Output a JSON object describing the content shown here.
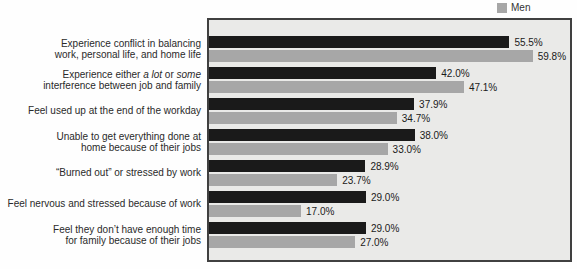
{
  "chart_data": {
    "type": "bar",
    "orientation": "horizontal",
    "title": "",
    "xlabel": "",
    "ylabel": "",
    "xlim": [
      0,
      66.7
    ],
    "grid": false,
    "plot": {
      "background": "#eaeae8",
      "border_color": "#404040"
    },
    "legend": {
      "position": "top-right",
      "items": [
        {
          "label": "Men",
          "color": "#a7a7a7"
        }
      ]
    },
    "categories": [
      {
        "lines": [
          "Experience conflict in balancing",
          "work, personal life, and home life"
        ]
      },
      {
        "lines": [
          [
            {
              "text": "Experience either "
            },
            {
              "text": "a lot",
              "italic": true
            },
            {
              "text": " or "
            },
            {
              "text": "some",
              "italic": true
            }
          ],
          "interference between job and family"
        ]
      },
      {
        "lines": [
          "Feel used up at the end of the workday"
        ]
      },
      {
        "lines": [
          "Unable to get everything done at",
          "home because of their jobs"
        ]
      },
      {
        "lines": [
          "“Burned out” or stressed by work"
        ]
      },
      {
        "lines": [
          "Feel nervous and stressed because of work"
        ]
      },
      {
        "lines": [
          "Feel they don’t have enough time",
          "for family because of their jobs"
        ]
      }
    ],
    "series": [
      {
        "legend_label": "",
        "color": "#1a1a1a",
        "values": [
          55.5,
          42.0,
          37.9,
          38.0,
          28.9,
          29.0,
          29.0
        ],
        "labels": [
          "55.5%",
          "42.0%",
          "37.9%",
          "38.0%",
          "28.9%",
          "29.0%",
          "29.0%"
        ]
      },
      {
        "legend_label": "Men",
        "color": "#a7a7a7",
        "values": [
          59.8,
          47.1,
          34.7,
          33.0,
          23.7,
          17.0,
          27.0
        ],
        "labels": [
          "59.8%",
          "47.1%",
          "34.7%",
          "33.0%",
          "23.7%",
          "17.0%",
          "27.0%"
        ]
      }
    ]
  }
}
